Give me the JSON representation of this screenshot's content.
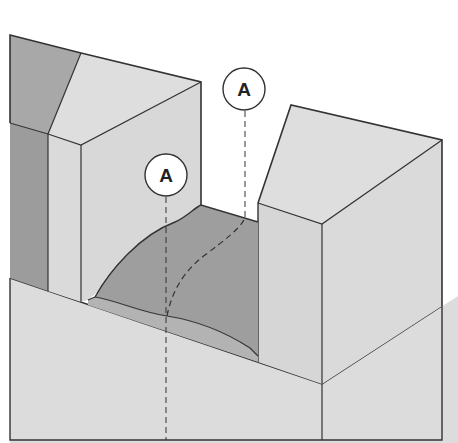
{
  "figure": {
    "type": "isometric cross-section illustration",
    "colors": {
      "background": "#ffffff",
      "light_face": "#dcdcdc",
      "mid_face": "#cfcfcf",
      "dark_face": "#9a9a9a",
      "mound": "#9e9e9e",
      "mound_band": "#b3b3b3",
      "outline": "#333333"
    },
    "labels": [
      {
        "id": "label-a-front",
        "text": "A",
        "cx": 166,
        "cy": 175
      },
      {
        "id": "label-a-back",
        "text": "A",
        "cx": 244,
        "cy": 89
      }
    ]
  }
}
